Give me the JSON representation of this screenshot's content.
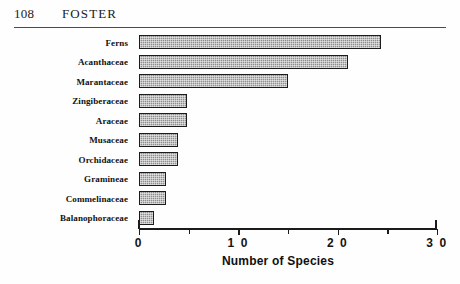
{
  "running_head": {
    "page_number": "108",
    "title": "FOSTER"
  },
  "chart_data": {
    "type": "bar",
    "orientation": "horizontal",
    "title": "",
    "subtitle": "",
    "xlabel": "Number of Species",
    "ylabel": "",
    "categories": [
      "Ferns",
      "Acanthaceae",
      "Marantaceae",
      "Zingiberaceae",
      "Araceae",
      "Musaceae",
      "Orchidaceae",
      "Gramineae",
      "Commelinaceae",
      "Balanophoraceae"
    ],
    "values": [
      24.4,
      21.0,
      15.0,
      4.8,
      4.8,
      3.9,
      3.9,
      2.7,
      2.7,
      1.5
    ],
    "xlim": [
      0,
      30
    ],
    "xticks": [
      0,
      10,
      20,
      30
    ],
    "xtick_labels": [
      "0",
      "1 0",
      "2 0",
      "3 0"
    ],
    "minor_xticks": [
      5,
      15,
      25
    ],
    "grid": false,
    "legend": null,
    "bar_fill_color": "#8e8e8e",
    "bar_edge_color": "#1b1b1b",
    "bar_pattern": "dotted-hatch"
  }
}
